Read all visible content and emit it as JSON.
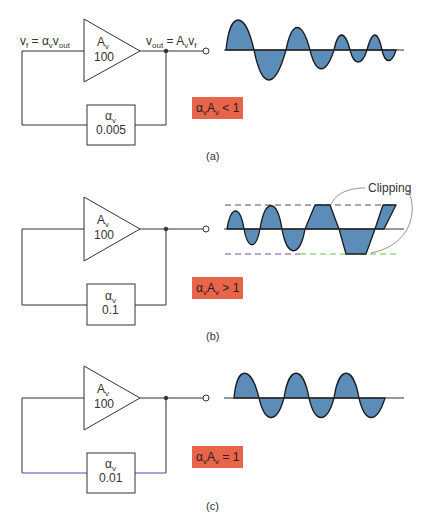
{
  "panels": [
    {
      "id": "a",
      "caption": "(a)",
      "amplifier": {
        "gain_symbol": "A",
        "gain_sub": "v",
        "gain_value": "100"
      },
      "feedback": {
        "symbol": "α",
        "sub": "v",
        "value": "0.005"
      },
      "input_label": "v_f = α_v v_out",
      "output_label": "v_out = A_v v_f",
      "condition": {
        "text": "α_vA_v < 1",
        "color": "#e8644a"
      },
      "waveform": "decaying oscillation"
    },
    {
      "id": "b",
      "caption": "(b)",
      "amplifier": {
        "gain_symbol": "A",
        "gain_sub": "v",
        "gain_value": "100"
      },
      "feedback": {
        "symbol": "α",
        "sub": "v",
        "value": "0.1"
      },
      "condition": {
        "text": "α_vA_v > 1",
        "color": "#e8644a"
      },
      "waveform": "growing oscillation with clipping",
      "annotation": "Clipping"
    },
    {
      "id": "c",
      "caption": "(c)",
      "amplifier": {
        "gain_symbol": "A",
        "gain_sub": "v",
        "gain_value": "100"
      },
      "feedback": {
        "symbol": "α",
        "sub": "v",
        "value": "0.01"
      },
      "condition": {
        "text": "α_vA_v = 1",
        "color": "#e8644a"
      },
      "waveform": "sustained oscillation"
    }
  ],
  "text": {
    "a_gain": "A",
    "a_gain_sub": "v",
    "a_gain_val": "100",
    "a_fb_sym": "α",
    "a_fb_sub": "v",
    "a_fb_val": "0.005",
    "a_in_v": "v",
    "a_in_sub": "f",
    "a_in_eq": " = α",
    "a_in_sub2": "v",
    "a_in_v2": "v",
    "a_in_sub3": "out",
    "a_out_v": "v",
    "a_out_sub": "out",
    "a_out_eq": " = A",
    "a_out_sub2": "v",
    "a_out_v2": "v",
    "a_out_sub3": "f",
    "a_cond_pre": "α",
    "a_cond_s1": "v",
    "a_cond_A": "A",
    "a_cond_s2": "v",
    "a_cond_post": " < 1",
    "a_cap": "(a)",
    "b_gain": "A",
    "b_gain_sub": "v",
    "b_gain_val": "100",
    "b_fb_sym": "α",
    "b_fb_sub": "v",
    "b_fb_val": "0.1",
    "b_cond_pre": "α",
    "b_cond_s1": "v",
    "b_cond_A": "A",
    "b_cond_s2": "v",
    "b_cond_post": " > 1",
    "b_cap": "(b)",
    "clipping": "Clipping",
    "c_gain": "A",
    "c_gain_sub": "v",
    "c_gain_val": "100",
    "c_fb_sym": "α",
    "c_fb_sub": "v",
    "c_fb_val": "0.01",
    "c_cond_pre": "α",
    "c_cond_s1": "v",
    "c_cond_A": "A",
    "c_cond_s2": "v",
    "c_cond_post": " = 1",
    "c_cap": "(c)"
  },
  "colors": {
    "wave_fill": "#5b8db8",
    "badge": "#e8644a",
    "line": "#333333"
  }
}
